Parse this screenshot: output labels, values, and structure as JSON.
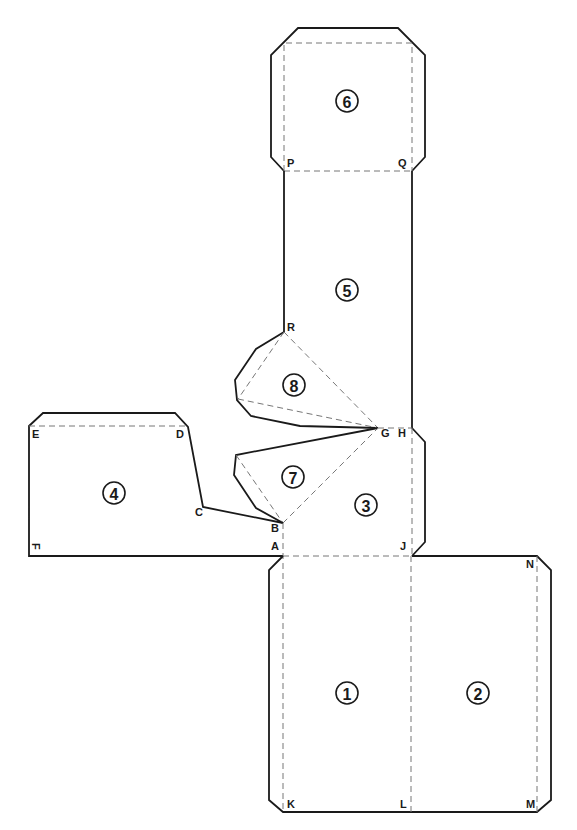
{
  "diagram": {
    "type": "papercraft-net",
    "panels": [
      {
        "id": "1",
        "label": "1",
        "cx": 347,
        "cy": 693
      },
      {
        "id": "2",
        "label": "2",
        "cx": 478,
        "cy": 693
      },
      {
        "id": "3",
        "label": "3",
        "cx": 366,
        "cy": 505
      },
      {
        "id": "4",
        "label": "4",
        "cx": 114,
        "cy": 493
      },
      {
        "id": "5",
        "label": "5",
        "cx": 347,
        "cy": 290
      },
      {
        "id": "6",
        "label": "6",
        "cx": 347,
        "cy": 101
      },
      {
        "id": "7",
        "label": "7",
        "cx": 293,
        "cy": 477
      },
      {
        "id": "8",
        "label": "8",
        "cx": 294,
        "cy": 385
      }
    ],
    "points": {
      "A": "A",
      "B": "B",
      "C": "C",
      "D": "D",
      "E": "E",
      "F": "F",
      "G": "G",
      "H": "H",
      "J": "J",
      "K": "K",
      "L": "L",
      "M": "M",
      "N": "N",
      "P": "P",
      "Q": "Q",
      "R": "R"
    },
    "colors": {
      "cut_line": "#1a1a1a",
      "fold_line": "#777777",
      "background": "#ffffff"
    }
  }
}
